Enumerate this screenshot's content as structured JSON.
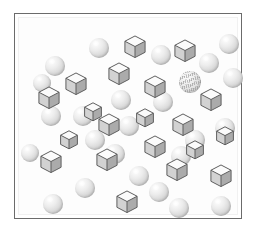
{
  "stimulus": {
    "title": "visual-search-array",
    "description": "Visual search display: grey shaded cubes and smooth grey spheres on a white panel, with one striated (textured) sphere as the odd target.",
    "panel": {
      "background_color": "#fdfdfd",
      "border_color": "#6b6b6b",
      "inner_border_color": "#f1f1f1",
      "width": 228,
      "height": 206
    },
    "palette": {
      "sphere_highlight": "#ffffff",
      "sphere_body": "#dcdcdc",
      "sphere_shadow": "#bdbdbd",
      "cube_top_face": "#fbfbfb",
      "cube_left_face": "#d2d2d2",
      "cube_right_face": "#ababab",
      "cube_outline": "#5f5f5f",
      "target_texture_line": "#8c8c8c"
    },
    "counts": {
      "cubes": 20,
      "plain_spheres": 20,
      "textured_spheres": 1,
      "total_items": 41
    },
    "cubes": [
      {
        "name": "cube-01",
        "x": 104,
        "y": 17,
        "size": 24
      },
      {
        "name": "cube-02",
        "x": 154,
        "y": 21,
        "size": 24
      },
      {
        "name": "cube-03",
        "x": 88,
        "y": 44,
        "size": 24
      },
      {
        "name": "cube-04",
        "x": 45,
        "y": 54,
        "size": 24
      },
      {
        "name": "cube-05",
        "x": 124,
        "y": 57,
        "size": 24
      },
      {
        "name": "cube-06",
        "x": 18,
        "y": 68,
        "size": 24
      },
      {
        "name": "cube-07",
        "x": 180,
        "y": 70,
        "size": 24
      },
      {
        "name": "cube-08",
        "x": 78,
        "y": 95,
        "size": 24
      },
      {
        "name": "cube-09",
        "x": 152,
        "y": 95,
        "size": 24
      },
      {
        "name": "cube-10",
        "x": 124,
        "y": 117,
        "size": 24
      },
      {
        "name": "cube-11",
        "x": 20,
        "y": 132,
        "size": 24
      },
      {
        "name": "cube-12",
        "x": 76,
        "y": 130,
        "size": 24
      },
      {
        "name": "cube-13",
        "x": 146,
        "y": 140,
        "size": 24
      },
      {
        "name": "cube-14",
        "x": 190,
        "y": 146,
        "size": 24
      },
      {
        "name": "cube-15",
        "x": 96,
        "y": 172,
        "size": 24
      },
      {
        "name": "cube-16",
        "x": 64,
        "y": 84,
        "size": 20
      },
      {
        "name": "cube-17",
        "x": 116,
        "y": 90,
        "size": 20
      },
      {
        "name": "cube-18",
        "x": 166,
        "y": 122,
        "size": 20
      },
      {
        "name": "cube-19",
        "x": 40,
        "y": 112,
        "size": 20
      },
      {
        "name": "cube-20",
        "x": 196,
        "y": 108,
        "size": 20
      }
    ],
    "spheres": [
      {
        "name": "sphere-01",
        "x": 70,
        "y": 20,
        "size": 20
      },
      {
        "name": "sphere-02",
        "x": 132,
        "y": 27,
        "size": 20
      },
      {
        "name": "sphere-03",
        "x": 180,
        "y": 35,
        "size": 20
      },
      {
        "name": "sphere-04",
        "x": 26,
        "y": 38,
        "size": 20
      },
      {
        "name": "sphere-05",
        "x": 204,
        "y": 50,
        "size": 20
      },
      {
        "name": "sphere-06",
        "x": 14,
        "y": 56,
        "size": 18
      },
      {
        "name": "sphere-07",
        "x": 92,
        "y": 72,
        "size": 20
      },
      {
        "name": "sphere-08",
        "x": 134,
        "y": 74,
        "size": 20
      },
      {
        "name": "sphere-09",
        "x": 22,
        "y": 88,
        "size": 20
      },
      {
        "name": "sphere-10",
        "x": 54,
        "y": 88,
        "size": 20
      },
      {
        "name": "sphere-11",
        "x": 100,
        "y": 98,
        "size": 20
      },
      {
        "name": "sphere-12",
        "x": 196,
        "y": 100,
        "size": 20
      },
      {
        "name": "sphere-13",
        "x": 166,
        "y": 112,
        "size": 20
      },
      {
        "name": "sphere-14",
        "x": 86,
        "y": 126,
        "size": 20
      },
      {
        "name": "sphere-15",
        "x": 2,
        "y": 126,
        "size": 18
      },
      {
        "name": "sphere-16",
        "x": 152,
        "y": 128,
        "size": 20
      },
      {
        "name": "sphere-17",
        "x": 110,
        "y": 148,
        "size": 20
      },
      {
        "name": "sphere-18",
        "x": 56,
        "y": 160,
        "size": 20
      },
      {
        "name": "sphere-19",
        "x": 130,
        "y": 164,
        "size": 20
      },
      {
        "name": "sphere-20",
        "x": 24,
        "y": 176,
        "size": 20
      },
      {
        "name": "sphere-21",
        "x": 150,
        "y": 180,
        "size": 20
      },
      {
        "name": "sphere-22",
        "x": 192,
        "y": 178,
        "size": 20
      },
      {
        "name": "sphere-23",
        "x": 200,
        "y": 16,
        "size": 20
      },
      {
        "name": "sphere-24",
        "x": 66,
        "y": 112,
        "size": 20
      }
    ],
    "target_sphere": {
      "name": "sphere-textured-target",
      "x": 160,
      "y": 53,
      "size": 22
    }
  }
}
